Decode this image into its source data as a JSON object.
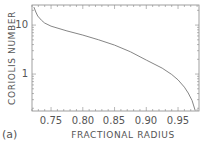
{
  "chart_data": {
    "type": "line",
    "title": "",
    "panel_label": "(a)",
    "xlabel": "FRACTIONAL RADIUS",
    "ylabel": "CORIOLIS NUMBER",
    "yscale": "log",
    "xlim": [
      0.72,
      0.983
    ],
    "ylim": [
      0.176,
      25.7
    ],
    "grid": false,
    "legend": null,
    "x_ticks": [
      0.75,
      0.8,
      0.85,
      0.9,
      0.95
    ],
    "x_tick_labels": [
      "0.75",
      "0.80",
      "0.85",
      "0.90",
      "0.95"
    ],
    "y_ticks": [
      1,
      10
    ],
    "y_tick_labels": [
      "1",
      "10"
    ],
    "series": [
      {
        "name": "Coriolis number",
        "color": "#777777",
        "x": [
          0.723,
          0.726,
          0.729,
          0.735,
          0.74,
          0.75,
          0.775,
          0.8,
          0.825,
          0.85,
          0.875,
          0.9,
          0.925,
          0.94,
          0.95,
          0.96,
          0.966,
          0.972,
          0.977
        ],
        "y": [
          23.3,
          18.5,
          15.3,
          12.5,
          11.0,
          9.5,
          7.6,
          6.25,
          5.0,
          3.9,
          2.85,
          1.93,
          1.32,
          0.98,
          0.76,
          0.54,
          0.41,
          0.29,
          0.18
        ]
      }
    ]
  },
  "labels": {
    "xlabel": "FRACTIONAL RADIUS",
    "ylabel": "CORIOLIS NUMBER",
    "panel": "(a)",
    "xt0": "0.75",
    "xt1": "0.80",
    "xt2": "0.85",
    "xt3": "0.90",
    "xt4": "0.95",
    "yt0": "1",
    "yt1": "10"
  }
}
